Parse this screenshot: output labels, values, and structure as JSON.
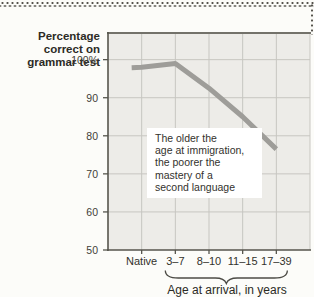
{
  "figure": {
    "ylabel_lines": [
      "Percentage",
      "correct on",
      "grammar test"
    ],
    "xlabel": "Age at arrival, in years",
    "annotation_lines": [
      "The older the",
      "age at immigration,",
      "the poorer the",
      "mastery of a",
      "second language"
    ]
  },
  "chart_data": {
    "type": "line",
    "title": "",
    "categories": [
      "Native",
      "3–7",
      "8–10",
      "11–15",
      "17–39"
    ],
    "values": [
      98,
      99,
      92.5,
      85,
      76.5
    ],
    "xlabel": "Age at arrival, in years",
    "ylabel": "Percentage correct on grammar test",
    "ylim": [
      50,
      107
    ],
    "yticks": [
      50,
      60,
      70,
      80,
      90,
      100
    ],
    "ytick_labels": [
      "50",
      "60",
      "70",
      "80",
      "90",
      "100%"
    ],
    "grid": true,
    "legend": "none",
    "annotation": "The older the age at immigration, the poorer the mastery of a second language",
    "line_color": "#9e9d99",
    "plot_bg": "#edece8",
    "grid_color": "#c7c6c1",
    "axis_color": "#56554d",
    "top_border_color": "#73726a",
    "dot_color": "#55534d"
  }
}
